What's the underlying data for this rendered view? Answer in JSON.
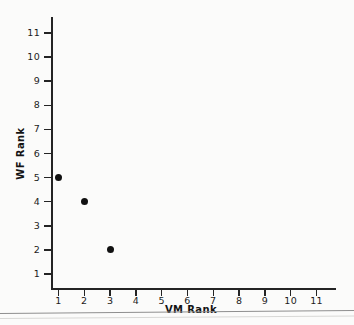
{
  "chart_data": {
    "type": "scatter",
    "title": "",
    "xlabel": "VM Rank",
    "ylabel": "WF Rank",
    "x": [
      1,
      2,
      3
    ],
    "y": [
      5,
      4,
      2
    ],
    "points": [
      {
        "x": 1,
        "y": 5
      },
      {
        "x": 2,
        "y": 4
      },
      {
        "x": 3,
        "y": 2
      }
    ],
    "xlim": [
      0,
      11.8
    ],
    "ylim": [
      0,
      11.6
    ],
    "x_ticks": [
      1,
      2,
      3,
      4,
      5,
      6,
      7,
      8,
      9,
      10,
      11
    ],
    "y_ticks": [
      1,
      2,
      3,
      4,
      5,
      6,
      7,
      8,
      9,
      10,
      11
    ],
    "x_tick_labels": [
      "1",
      "2",
      "3",
      "4",
      "5",
      "6",
      "7",
      "8",
      "9",
      "10",
      "11"
    ],
    "y_tick_labels": [
      "1",
      "2",
      "3",
      "4",
      "5",
      "6",
      "7",
      "8",
      "9",
      "10",
      "11"
    ],
    "grid": false,
    "legend": null,
    "marker": "filled-circle",
    "marker_color": "#111111",
    "axis_color": "#242424",
    "background_color": "#fbfbfa"
  }
}
